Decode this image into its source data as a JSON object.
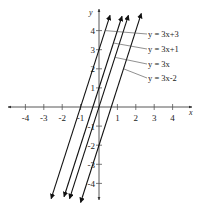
{
  "chart_data": {
    "type": "line",
    "title": "",
    "xlabel": "x",
    "ylabel": "y",
    "xlim": [
      -4.8,
      4.9
    ],
    "ylim": [
      -4.9,
      5.2
    ],
    "grid": false,
    "x_ticks": [
      -4,
      -3,
      -2,
      -1,
      1,
      2,
      3,
      4
    ],
    "y_ticks": [
      4,
      3,
      2,
      1,
      -1,
      -2,
      -3,
      -4
    ],
    "x_tick_labels": [
      "-4",
      "-3",
      "-2",
      "-1",
      "1",
      "2",
      "3",
      "4"
    ],
    "y_tick_labels": [
      "4",
      "3",
      "2",
      "1",
      "-1",
      "-2",
      "-3",
      "-4"
    ],
    "series": [
      {
        "name": "y = 3x+3",
        "slope": 3,
        "intercept": 3,
        "x_range": [
          -2.6,
          0.6
        ]
      },
      {
        "name": "y = 3x+1",
        "slope": 3,
        "intercept": 1,
        "x_range": [
          -1.9,
          1.25
        ]
      },
      {
        "name": "y = 3x",
        "slope": 3,
        "intercept": 0,
        "x_range": [
          -1.6,
          1.6
        ]
      },
      {
        "name": "y = 3x-2",
        "slope": 3,
        "intercept": -2,
        "x_range": [
          -1.0,
          2.3
        ]
      }
    ],
    "legend": {
      "position": "upper right",
      "entries": [
        "y = 3x+3",
        "y = 3x+1",
        "y = 3x",
        "y = 3x-2"
      ]
    },
    "line_color": "#111111"
  }
}
